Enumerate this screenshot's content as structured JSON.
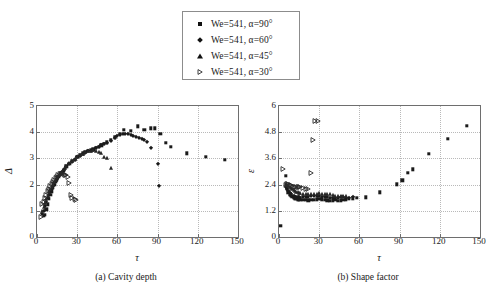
{
  "legend": {
    "entries": [
      {
        "marker": "filled-square",
        "label": "We=541, α=90°"
      },
      {
        "marker": "filled-diamond",
        "label": "We=541, α=60°"
      },
      {
        "marker": "filled-triangle-up",
        "label": "We=541, α=45°"
      },
      {
        "marker": "open-triangle-right",
        "label": "We=541, α=30°"
      }
    ]
  },
  "captions": {
    "panel_a": "(a) Cavity depth",
    "panel_b": "(b) Shape factor"
  },
  "chart_data": [
    {
      "type": "scatter",
      "panel": "a",
      "title": "(a) Cavity depth",
      "xlabel": "τ",
      "ylabel": "Δ",
      "xlim": [
        0,
        150
      ],
      "ylim": [
        0,
        5
      ],
      "xticks": [
        0,
        30,
        60,
        90,
        120,
        150
      ],
      "yticks": [
        0,
        1,
        2,
        3,
        4,
        5
      ],
      "xticklabels": [
        "0",
        "30",
        "60",
        "90",
        "120",
        "150"
      ],
      "yticklabels": [
        "0",
        "1",
        "2",
        "3",
        "4",
        "5"
      ],
      "grid": true,
      "legend_position": "above-figure",
      "series": [
        {
          "name": "We=541, α=90°",
          "marker": "filled-square",
          "x": [
            5,
            6,
            7,
            8,
            9,
            10,
            11,
            12,
            13,
            14,
            15,
            16,
            18,
            20,
            22,
            24,
            26,
            28,
            30,
            32,
            34,
            36,
            38,
            40,
            42,
            44,
            46,
            48,
            50,
            52,
            55,
            58,
            62,
            65,
            70,
            75,
            80,
            85,
            88,
            92,
            96,
            100,
            112,
            126,
            140
          ],
          "y": [
            0.82,
            0.85,
            1.05,
            1.25,
            1.45,
            1.6,
            1.75,
            1.9,
            2.0,
            2.1,
            2.2,
            2.3,
            2.45,
            2.55,
            2.7,
            2.8,
            2.9,
            2.95,
            3.05,
            3.12,
            3.2,
            3.25,
            3.3,
            3.32,
            3.35,
            3.4,
            3.45,
            3.5,
            3.55,
            3.62,
            3.7,
            3.8,
            3.95,
            4.1,
            4.05,
            4.22,
            4.08,
            4.15,
            4.15,
            3.95,
            3.6,
            3.45,
            3.2,
            3.05,
            2.95
          ]
        },
        {
          "name": "We=541, α=60°",
          "marker": "filled-diamond",
          "x": [
            4,
            5,
            6,
            7,
            8,
            9,
            10,
            11,
            12,
            13,
            14,
            15,
            16,
            17,
            18,
            19,
            20,
            22,
            24,
            26,
            28,
            30,
            32,
            34,
            36,
            38,
            40,
            42,
            44,
            46,
            48,
            50,
            52,
            55,
            58,
            60,
            62,
            64,
            66,
            68,
            70,
            72,
            74,
            76,
            78,
            80,
            82,
            85,
            90,
            91
          ],
          "y": [
            0.88,
            1.0,
            1.2,
            1.35,
            1.5,
            1.62,
            1.72,
            1.85,
            1.95,
            2.05,
            2.15,
            2.22,
            2.3,
            2.38,
            2.45,
            2.5,
            2.55,
            2.68,
            2.78,
            2.88,
            2.95,
            3.05,
            3.1,
            3.18,
            3.22,
            3.28,
            3.3,
            3.33,
            3.4,
            3.45,
            3.5,
            3.55,
            3.6,
            3.68,
            3.78,
            3.85,
            3.9,
            3.93,
            3.95,
            3.92,
            3.88,
            3.85,
            3.82,
            3.78,
            3.75,
            3.72,
            3.62,
            3.4,
            2.78,
            1.95
          ]
        },
        {
          "name": "We=541, α=45°",
          "marker": "filled-triangle-up",
          "x": [
            4,
            5,
            6,
            7,
            8,
            9,
            10,
            11,
            12,
            13,
            14,
            15,
            16,
            17,
            18,
            19,
            20,
            21,
            22,
            24,
            26,
            28,
            30,
            32,
            34,
            36,
            38,
            40,
            42,
            44,
            46,
            48,
            50,
            52,
            55
          ],
          "y": [
            1.0,
            1.15,
            1.3,
            1.45,
            1.58,
            1.7,
            1.82,
            1.92,
            2.0,
            2.1,
            2.18,
            2.25,
            2.32,
            2.4,
            2.45,
            2.5,
            2.58,
            2.65,
            2.7,
            2.82,
            2.9,
            2.98,
            3.05,
            3.12,
            3.18,
            3.25,
            3.28,
            3.3,
            3.32,
            3.3,
            3.25,
            3.2,
            3.05,
            3.0,
            2.62
          ]
        },
        {
          "name": "We=541, α=30°",
          "marker": "open-triangle-right",
          "x": [
            3,
            4,
            5,
            6,
            7,
            8,
            9,
            10,
            11,
            12,
            13,
            14,
            15,
            16,
            17,
            18,
            19,
            20,
            21,
            22,
            23,
            24,
            25,
            26,
            28,
            29
          ],
          "y": [
            0.78,
            1.25,
            1.35,
            1.5,
            1.62,
            1.75,
            1.85,
            1.95,
            2.02,
            2.1,
            2.18,
            2.25,
            2.3,
            2.35,
            2.4,
            2.42,
            2.42,
            2.4,
            2.38,
            2.35,
            2.3,
            2.05,
            1.62,
            1.5,
            1.45,
            1.42
          ]
        }
      ]
    },
    {
      "type": "scatter",
      "panel": "b",
      "title": "(b) Shape factor",
      "xlabel": "τ",
      "ylabel": "ε",
      "xlim": [
        0,
        150
      ],
      "ylim": [
        0,
        6
      ],
      "xticks": [
        0,
        30,
        60,
        90,
        120,
        150
      ],
      "yticks": [
        0,
        1.2,
        2.4,
        3.6,
        4.8,
        6
      ],
      "xticklabels": [
        "0",
        "30",
        "60",
        "90",
        "120",
        "150"
      ],
      "yticklabels": [
        "0",
        "1.2",
        "2.4",
        "3.6",
        "4.8",
        "6"
      ],
      "grid": true,
      "legend_position": "above-figure",
      "series": [
        {
          "name": "We=541, α=90°",
          "marker": "filled-square",
          "x": [
            1,
            5,
            6,
            7,
            8,
            9,
            10,
            11,
            12,
            13,
            14,
            15,
            16,
            18,
            20,
            22,
            24,
            26,
            28,
            30,
            32,
            34,
            36,
            38,
            40,
            42,
            44,
            46,
            48,
            50,
            52,
            55,
            58,
            65,
            75,
            88,
            92,
            96,
            100,
            112,
            126,
            140
          ],
          "y": [
            0.5,
            2.8,
            2.2,
            2.05,
            1.95,
            1.9,
            1.85,
            1.8,
            1.78,
            1.75,
            1.72,
            1.72,
            1.7,
            1.7,
            1.7,
            1.68,
            1.7,
            1.7,
            1.72,
            1.75,
            1.72,
            1.7,
            1.68,
            1.65,
            1.68,
            1.7,
            1.65,
            1.68,
            1.7,
            1.72,
            1.75,
            1.78,
            1.8,
            1.82,
            2.05,
            2.42,
            2.6,
            2.95,
            3.1,
            3.8,
            4.5,
            5.1
          ]
        },
        {
          "name": "We=541, α=60°",
          "marker": "filled-diamond",
          "x": [
            5,
            6,
            7,
            8,
            9,
            10,
            11,
            12,
            13,
            14,
            15,
            16,
            18,
            20,
            22,
            24,
            26,
            28,
            30,
            32,
            34,
            36,
            38,
            40,
            42,
            44,
            46,
            48,
            50,
            52,
            55
          ],
          "y": [
            2.3,
            2.2,
            2.1,
            2.0,
            1.95,
            1.9,
            1.88,
            1.85,
            1.85,
            1.82,
            1.82,
            1.8,
            1.82,
            1.85,
            1.85,
            1.88,
            1.88,
            1.9,
            1.88,
            1.85,
            1.85,
            1.82,
            1.8,
            1.78,
            1.78,
            1.8,
            1.82,
            1.82,
            1.8,
            1.8,
            1.82
          ]
        },
        {
          "name": "We=541, α=45°",
          "marker": "filled-triangle-up",
          "x": [
            5,
            6,
            7,
            8,
            9,
            10,
            11,
            12,
            13,
            14,
            15,
            16,
            18,
            20,
            22,
            24,
            26,
            28,
            30,
            32,
            34,
            36,
            38,
            40,
            42,
            44,
            46,
            48,
            50
          ],
          "y": [
            2.45,
            2.4,
            2.35,
            2.3,
            2.25,
            2.2,
            2.15,
            2.1,
            2.08,
            2.05,
            2.02,
            2.0,
            1.98,
            1.95,
            1.95,
            1.95,
            1.95,
            1.98,
            2.0,
            1.98,
            1.95,
            1.95,
            1.95,
            1.92,
            1.9,
            1.9,
            1.9,
            1.9,
            1.88
          ]
        },
        {
          "name": "We=541, α=30°",
          "marker": "open-triangle-right",
          "x": [
            3,
            5,
            6,
            7,
            8,
            9,
            10,
            11,
            12,
            13,
            14,
            15,
            16,
            18,
            20,
            22,
            24,
            25,
            27,
            29
          ],
          "y": [
            3.1,
            2.4,
            2.42,
            2.45,
            2.4,
            2.38,
            2.35,
            2.3,
            2.3,
            2.28,
            2.28,
            2.3,
            2.3,
            2.25,
            2.22,
            2.18,
            2.95,
            4.45,
            5.3,
            5.3
          ]
        }
      ]
    }
  ]
}
